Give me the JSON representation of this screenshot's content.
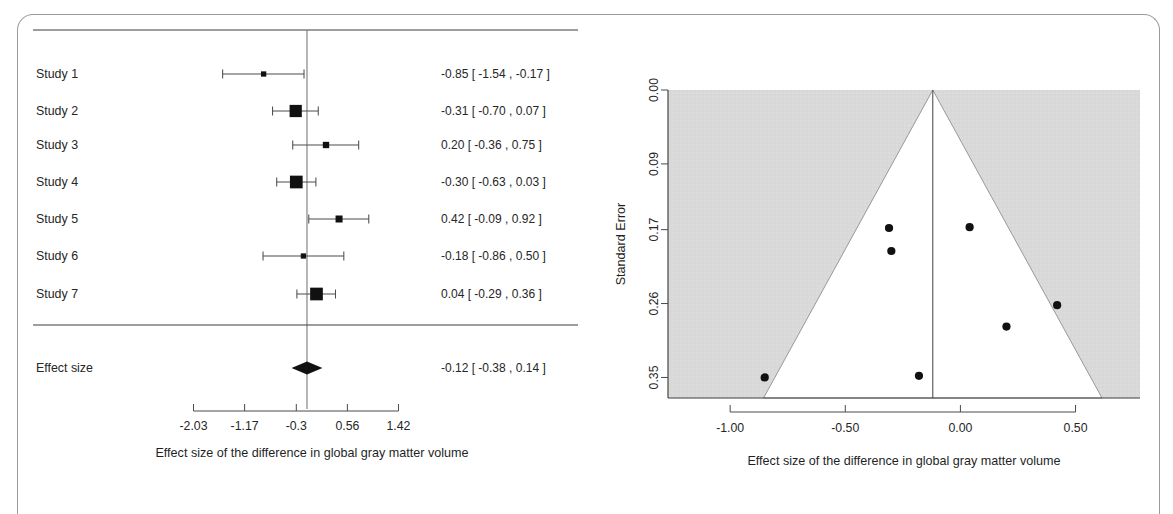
{
  "figure": {
    "frame_border_color": "#9a9a9a",
    "background": "#ffffff"
  },
  "chart_data": [
    {
      "type": "forest",
      "title": "",
      "xlabel": "Effect size of the difference in global gray matter volume",
      "ylabel": "",
      "xlim": [
        -2.46,
        1.85
      ],
      "xticks": [
        "-2.03",
        "-1.17",
        "-0.3",
        "0.56",
        "1.42"
      ],
      "xtick_values": [
        -2.03,
        -1.17,
        -0.3,
        0.56,
        1.42
      ],
      "grid": false,
      "reference_line": -0.12,
      "study_label_header": "",
      "estimate_header": "",
      "rows": [
        {
          "label": "Study  1",
          "estimate": -0.85,
          "ci_low": -1.54,
          "ci_high": -0.17,
          "text": "-0.85 [ -1.54 ,  -0.17 ]",
          "weight": 0.22
        },
        {
          "label": "Study  2",
          "estimate": -0.31,
          "ci_low": -0.7,
          "ci_high": 0.07,
          "text": "-0.31 [ -0.70 ,  0.07 ]",
          "weight": 0.95
        },
        {
          "label": "Study  3",
          "estimate": 0.2,
          "ci_low": -0.36,
          "ci_high": 0.75,
          "text": "0.20 [ -0.36 ,  0.75 ]",
          "weight": 0.33
        },
        {
          "label": "Study  4",
          "estimate": -0.3,
          "ci_low": -0.63,
          "ci_high": 0.03,
          "text": "-0.30 [ -0.63 ,  0.03 ]",
          "weight": 1.0
        },
        {
          "label": "Study  5",
          "estimate": 0.42,
          "ci_low": -0.09,
          "ci_high": 0.92,
          "text": "0.42 [ -0.09 ,  0.92 ]",
          "weight": 0.4
        },
        {
          "label": "Study  6",
          "estimate": -0.18,
          "ci_low": -0.86,
          "ci_high": 0.5,
          "text": "-0.18 [ -0.86 ,  0.50 ]",
          "weight": 0.22
        },
        {
          "label": "Study  7",
          "estimate": 0.04,
          "ci_low": -0.29,
          "ci_high": 0.36,
          "text": "0.04 [ -0.29 ,  0.36 ]",
          "weight": 1.0
        }
      ],
      "summary": {
        "label": "Effect size",
        "estimate": -0.12,
        "ci_low": -0.38,
        "ci_high": 0.14,
        "text": "-0.12 [ -0.38 ,  0.14 ]"
      }
    },
    {
      "type": "funnel",
      "title": "",
      "xlabel": "Effect size of the difference in global gray matter volume",
      "ylabel": "Standard Error",
      "xlim": [
        -1.27,
        0.78
      ],
      "ylim": [
        0.0,
        0.375
      ],
      "xticks": [
        "-1.00",
        "-0.50",
        "0.00",
        "0.50"
      ],
      "xtick_values": [
        -1.0,
        -0.5,
        0.0,
        0.5
      ],
      "yticks": [
        "0.00",
        "0.09",
        "0.17",
        "0.26",
        "0.35"
      ],
      "ytick_values": [
        0.0,
        0.09,
        0.17,
        0.26,
        0.35
      ],
      "grid": false,
      "shade_color": "#d9d9d9",
      "funnel_center": -0.12,
      "pseudo_ci_region": "white funnel (1.96 SE) on gray background",
      "reference_line": -0.12,
      "points": [
        {
          "x": -0.85,
          "y": 0.35
        },
        {
          "x": -0.31,
          "y": 0.168
        },
        {
          "x": -0.3,
          "y": 0.196
        },
        {
          "x": 0.2,
          "y": 0.288
        },
        {
          "x": 0.42,
          "y": 0.262
        },
        {
          "x": -0.18,
          "y": 0.348
        },
        {
          "x": 0.04,
          "y": 0.167
        }
      ]
    }
  ]
}
